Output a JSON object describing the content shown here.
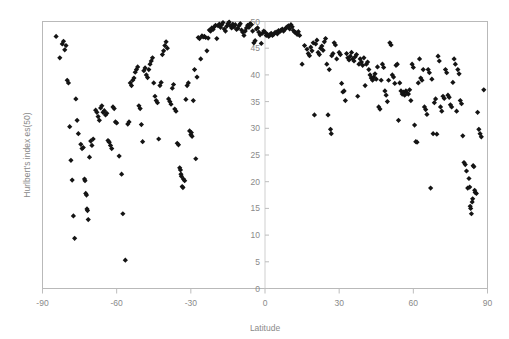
{
  "chart_data": {
    "type": "scatter",
    "title": "",
    "xlabel": "Latitude",
    "ylabel": "Hurlbert's index es(50)",
    "xlim": [
      -90,
      90
    ],
    "ylim": [
      0,
      50
    ],
    "xticks": [
      -90,
      -60,
      -30,
      0,
      30,
      60,
      90
    ],
    "xtick_labels": [
      "-90",
      "-60",
      "-30",
      "0",
      "30",
      "60",
      "90"
    ],
    "yticks": [
      0,
      5,
      10,
      15,
      20,
      25,
      30,
      35,
      40,
      45,
      50
    ],
    "ytick_labels": [
      "0",
      "5",
      "10",
      "15",
      "20",
      "25",
      "30",
      "35",
      "40",
      "45",
      "50"
    ],
    "grid": false,
    "legend": null,
    "marker": "diamond",
    "marker_color": "#141414",
    "marker_size": 4,
    "points": [
      [
        -84.5,
        47.2
      ],
      [
        -83.0,
        43.2
      ],
      [
        -82.0,
        45.8
      ],
      [
        -81.5,
        46.3
      ],
      [
        -81.0,
        44.7
      ],
      [
        -80.5,
        45.5
      ],
      [
        -80.0,
        39.0
      ],
      [
        -79.5,
        38.5
      ],
      [
        -79.0,
        30.3
      ],
      [
        -78.5,
        24.0
      ],
      [
        -78.0,
        20.3
      ],
      [
        -77.5,
        13.6
      ],
      [
        -77.0,
        9.4
      ],
      [
        -76.5,
        35.5
      ],
      [
        -76.0,
        31.5
      ],
      [
        -75.5,
        29.0
      ],
      [
        -74.5,
        27.0
      ],
      [
        -74.0,
        26.2
      ],
      [
        -73.5,
        26.4
      ],
      [
        -73.0,
        20.5
      ],
      [
        -72.8,
        20.2
      ],
      [
        -72.5,
        17.8
      ],
      [
        -72.2,
        17.5
      ],
      [
        -72.0,
        14.9
      ],
      [
        -71.8,
        14.6
      ],
      [
        -71.5,
        12.9
      ],
      [
        -71.0,
        24.6
      ],
      [
        -70.5,
        27.6
      ],
      [
        -70.0,
        26.8
      ],
      [
        -69.5,
        28.0
      ],
      [
        -68.5,
        33.4
      ],
      [
        -68.0,
        33.0
      ],
      [
        -67.5,
        32.2
      ],
      [
        -67.0,
        31.5
      ],
      [
        -66.5,
        33.8
      ],
      [
        -66.0,
        34.2
      ],
      [
        -65.5,
        33.0
      ],
      [
        -65.0,
        33.3
      ],
      [
        -64.5,
        32.5
      ],
      [
        -64.0,
        32.8
      ],
      [
        -63.5,
        27.7
      ],
      [
        -63.0,
        27.4
      ],
      [
        -62.5,
        26.8
      ],
      [
        -62.0,
        26.2
      ],
      [
        -61.5,
        34.0
      ],
      [
        -61.0,
        33.7
      ],
      [
        -60.5,
        31.2
      ],
      [
        -60.0,
        31.0
      ],
      [
        -59.0,
        24.8
      ],
      [
        -58.0,
        21.4
      ],
      [
        -57.5,
        14.0
      ],
      [
        -56.5,
        5.3
      ],
      [
        -55.5,
        30.8
      ],
      [
        -55.0,
        31.2
      ],
      [
        -54.5,
        38.5
      ],
      [
        -54.0,
        38.0
      ],
      [
        -53.5,
        39.0
      ],
      [
        -53.0,
        39.4
      ],
      [
        -52.5,
        40.5
      ],
      [
        -52.0,
        41.0
      ],
      [
        -51.5,
        41.5
      ],
      [
        -51.0,
        34.2
      ],
      [
        -50.5,
        33.7
      ],
      [
        -50.0,
        30.7
      ],
      [
        -49.5,
        27.5
      ],
      [
        -49.0,
        40.8
      ],
      [
        -48.5,
        41.3
      ],
      [
        -48.0,
        40.0
      ],
      [
        -47.5,
        39.5
      ],
      [
        -47.0,
        41.0
      ],
      [
        -46.5,
        42.0
      ],
      [
        -46.0,
        42.6
      ],
      [
        -45.5,
        43.2
      ],
      [
        -45.0,
        38.5
      ],
      [
        -44.5,
        36.0
      ],
      [
        -44.0,
        35.2
      ],
      [
        -43.5,
        34.8
      ],
      [
        -43.0,
        28.0
      ],
      [
        -42.5,
        38.0
      ],
      [
        -42.0,
        38.6
      ],
      [
        -41.5,
        43.8
      ],
      [
        -41.0,
        44.5
      ],
      [
        -40.5,
        45.5
      ],
      [
        -40.0,
        46.2
      ],
      [
        -39.5,
        45.0
      ],
      [
        -39.0,
        35.5
      ],
      [
        -38.5,
        35.0
      ],
      [
        -38.0,
        34.5
      ],
      [
        -37.5,
        37.5
      ],
      [
        -37.0,
        38.2
      ],
      [
        -36.5,
        33.6
      ],
      [
        -36.0,
        33.2
      ],
      [
        -35.5,
        27.2
      ],
      [
        -35.0,
        26.9
      ],
      [
        -34.5,
        22.6
      ],
      [
        -34.2,
        22.2
      ],
      [
        -34.0,
        21.4
      ],
      [
        -33.8,
        21.0
      ],
      [
        -33.5,
        19.1
      ],
      [
        -33.2,
        18.9
      ],
      [
        -33.0,
        20.5
      ],
      [
        -32.5,
        20.2
      ],
      [
        -32.0,
        35.4
      ],
      [
        -31.5,
        38.0
      ],
      [
        -31.0,
        38.5
      ],
      [
        -30.5,
        29.5
      ],
      [
        -30.0,
        28.8
      ],
      [
        -29.8,
        29.2
      ],
      [
        -29.5,
        28.5
      ],
      [
        -29.0,
        35.2
      ],
      [
        -28.5,
        41.0
      ],
      [
        -28.0,
        24.3
      ],
      [
        -27.5,
        39.6
      ],
      [
        -27.0,
        47.0
      ],
      [
        -26.5,
        46.8
      ],
      [
        -26.0,
        43.0
      ],
      [
        -25.5,
        47.3
      ],
      [
        -25.0,
        47.1
      ],
      [
        -24.5,
        47.2
      ],
      [
        -24.0,
        47.0
      ],
      [
        -23.5,
        44.5
      ],
      [
        -23.0,
        46.9
      ],
      [
        -22.5,
        48.4
      ],
      [
        -22.0,
        48.2
      ],
      [
        -21.5,
        48.8
      ],
      [
        -21.0,
        48.5
      ],
      [
        -20.5,
        49.0
      ],
      [
        -20.0,
        49.3
      ],
      [
        -19.5,
        46.8
      ],
      [
        -19.0,
        49.2
      ],
      [
        -18.5,
        49.5
      ],
      [
        -18.0,
        48.9
      ],
      [
        -17.5,
        49.4
      ],
      [
        -17.0,
        49.8
      ],
      [
        -16.5,
        48.6
      ],
      [
        -16.0,
        48.2
      ],
      [
        -15.5,
        49.1
      ],
      [
        -15.0,
        49.6
      ],
      [
        -14.5,
        49.9
      ],
      [
        -14.0,
        49.2
      ],
      [
        -13.5,
        48.8
      ],
      [
        -13.0,
        49.5
      ],
      [
        -12.5,
        49.0
      ],
      [
        -12.0,
        49.4
      ],
      [
        -11.5,
        48.5
      ],
      [
        -11.0,
        48.7
      ],
      [
        -10.5,
        49.2
      ],
      [
        -10.0,
        49.6
      ],
      [
        -9.5,
        48.4
      ],
      [
        -9.0,
        48.0
      ],
      [
        -8.5,
        47.4
      ],
      [
        -8.0,
        48.2
      ],
      [
        -7.5,
        48.8
      ],
      [
        -7.0,
        49.3
      ],
      [
        -6.5,
        48.9
      ],
      [
        -6.0,
        49.6
      ],
      [
        -5.5,
        49.4
      ],
      [
        -5.0,
        48.2
      ],
      [
        -4.5,
        46.0
      ],
      [
        -4.0,
        46.4
      ],
      [
        -3.5,
        48.6
      ],
      [
        -3.0,
        48.8
      ],
      [
        -2.5,
        48.0
      ],
      [
        -2.0,
        47.5
      ],
      [
        -1.5,
        45.9
      ],
      [
        -1.0,
        47.8
      ],
      [
        -0.5,
        48.2
      ],
      [
        0.0,
        48.0
      ],
      [
        0.5,
        47.4
      ],
      [
        1.0,
        47.6
      ],
      [
        1.5,
        47.2
      ],
      [
        2.0,
        47.5
      ],
      [
        2.5,
        47.8
      ],
      [
        3.0,
        47.4
      ],
      [
        3.5,
        47.6
      ],
      [
        4.0,
        47.9
      ],
      [
        4.5,
        48.0
      ],
      [
        5.0,
        47.7
      ],
      [
        5.5,
        48.3
      ],
      [
        6.0,
        48.1
      ],
      [
        6.5,
        48.4
      ],
      [
        7.0,
        48.6
      ],
      [
        7.5,
        48.2
      ],
      [
        8.0,
        48.5
      ],
      [
        8.5,
        48.8
      ],
      [
        9.0,
        49.0
      ],
      [
        9.5,
        49.2
      ],
      [
        10.0,
        48.6
      ],
      [
        10.5,
        49.4
      ],
      [
        11.0,
        49.0
      ],
      [
        11.5,
        48.3
      ],
      [
        12.0,
        48.0
      ],
      [
        12.5,
        47.9
      ],
      [
        13.0,
        47.6
      ],
      [
        13.5,
        48.1
      ],
      [
        14.0,
        47.4
      ],
      [
        15.0,
        42.0
      ],
      [
        16.0,
        45.5
      ],
      [
        17.0,
        44.8
      ],
      [
        17.5,
        44.0
      ],
      [
        18.0,
        43.6
      ],
      [
        18.5,
        45.2
      ],
      [
        19.0,
        44.5
      ],
      [
        19.5,
        46.0
      ],
      [
        20.0,
        32.5
      ],
      [
        20.5,
        45.8
      ],
      [
        21.0,
        46.5
      ],
      [
        21.5,
        44.2
      ],
      [
        22.0,
        43.8
      ],
      [
        22.5,
        45.0
      ],
      [
        23.0,
        45.4
      ],
      [
        23.5,
        44.6
      ],
      [
        24.0,
        46.2
      ],
      [
        24.5,
        46.8
      ],
      [
        25.0,
        42.0
      ],
      [
        25.5,
        32.5
      ],
      [
        26.0,
        41.0
      ],
      [
        26.5,
        29.8
      ],
      [
        26.8,
        29.0
      ],
      [
        27.0,
        43.6
      ],
      [
        27.5,
        44.0
      ],
      [
        28.0,
        46.0
      ],
      [
        28.5,
        45.6
      ],
      [
        29.0,
        43.0
      ],
      [
        30.0,
        44.2
      ],
      [
        30.5,
        43.8
      ],
      [
        31.0,
        38.4
      ],
      [
        31.5,
        36.8
      ],
      [
        32.0,
        37.0
      ],
      [
        32.5,
        35.2
      ],
      [
        33.0,
        44.0
      ],
      [
        33.5,
        43.2
      ],
      [
        34.0,
        42.8
      ],
      [
        34.5,
        43.5
      ],
      [
        35.0,
        44.2
      ],
      [
        35.5,
        43.0
      ],
      [
        36.0,
        42.6
      ],
      [
        36.5,
        43.4
      ],
      [
        37.0,
        43.8
      ],
      [
        37.5,
        36.0
      ],
      [
        38.0,
        42.0
      ],
      [
        38.5,
        43.0
      ],
      [
        39.0,
        42.4
      ],
      [
        39.5,
        41.8
      ],
      [
        40.0,
        43.2
      ],
      [
        40.5,
        38.0
      ],
      [
        41.0,
        42.0
      ],
      [
        41.5,
        42.4
      ],
      [
        42.0,
        41.0
      ],
      [
        42.5,
        40.0
      ],
      [
        43.0,
        39.4
      ],
      [
        43.5,
        39.0
      ],
      [
        44.0,
        39.6
      ],
      [
        44.5,
        40.2
      ],
      [
        45.0,
        39.2
      ],
      [
        45.5,
        41.5
      ],
      [
        46.0,
        34.0
      ],
      [
        46.5,
        33.6
      ],
      [
        47.0,
        39.0
      ],
      [
        47.5,
        42.0
      ],
      [
        48.0,
        41.4
      ],
      [
        48.5,
        37.0
      ],
      [
        49.0,
        36.2
      ],
      [
        49.5,
        35.0
      ],
      [
        50.0,
        39.0
      ],
      [
        50.5,
        46.0
      ],
      [
        51.0,
        45.6
      ],
      [
        51.5,
        40.0
      ],
      [
        52.0,
        39.6
      ],
      [
        52.5,
        38.4
      ],
      [
        53.0,
        41.8
      ],
      [
        53.5,
        42.0
      ],
      [
        54.0,
        31.5
      ],
      [
        54.5,
        38.5
      ],
      [
        55.0,
        37.0
      ],
      [
        55.5,
        36.4
      ],
      [
        56.0,
        36.8
      ],
      [
        56.5,
        36.2
      ],
      [
        57.0,
        37.0
      ],
      [
        57.5,
        36.6
      ],
      [
        58.0,
        36.4
      ],
      [
        58.5,
        37.2
      ],
      [
        59.0,
        35.2
      ],
      [
        59.5,
        42.0
      ],
      [
        60.0,
        41.4
      ],
      [
        60.5,
        30.6
      ],
      [
        61.0,
        27.5
      ],
      [
        61.5,
        27.4
      ],
      [
        62.0,
        38.5
      ],
      [
        62.5,
        43.0
      ],
      [
        63.0,
        39.4
      ],
      [
        63.5,
        39.0
      ],
      [
        64.0,
        41.0
      ],
      [
        64.5,
        34.0
      ],
      [
        65.0,
        33.5
      ],
      [
        65.5,
        32.6
      ],
      [
        66.0,
        41.0
      ],
      [
        66.5,
        40.4
      ],
      [
        67.0,
        18.8
      ],
      [
        67.5,
        39.2
      ],
      [
        68.0,
        29.0
      ],
      [
        68.5,
        34.8
      ],
      [
        69.0,
        35.5
      ],
      [
        69.5,
        28.9
      ],
      [
        70.0,
        43.5
      ],
      [
        70.5,
        42.6
      ],
      [
        71.0,
        34.0
      ],
      [
        71.5,
        33.2
      ],
      [
        72.0,
        36.0
      ],
      [
        72.5,
        35.6
      ],
      [
        73.0,
        41.0
      ],
      [
        73.5,
        40.4
      ],
      [
        74.0,
        36.2
      ],
      [
        74.5,
        35.8
      ],
      [
        75.0,
        34.4
      ],
      [
        75.5,
        34.0
      ],
      [
        76.0,
        38.6
      ],
      [
        76.5,
        43.0
      ],
      [
        77.0,
        42.0
      ],
      [
        77.5,
        33.2
      ],
      [
        78.0,
        41.0
      ],
      [
        78.5,
        40.2
      ],
      [
        79.0,
        35.2
      ],
      [
        79.5,
        34.6
      ],
      [
        80.0,
        28.6
      ],
      [
        80.5,
        23.6
      ],
      [
        81.0,
        23.2
      ],
      [
        81.5,
        22.0
      ],
      [
        82.0,
        18.8
      ],
      [
        82.5,
        20.6
      ],
      [
        82.8,
        19.0
      ],
      [
        83.0,
        15.4
      ],
      [
        83.2,
        15.0
      ],
      [
        83.5,
        14.0
      ],
      [
        83.8,
        16.2
      ],
      [
        84.0,
        16.8
      ],
      [
        84.2,
        23.0
      ],
      [
        84.5,
        22.8
      ],
      [
        84.8,
        18.4
      ],
      [
        85.0,
        18.0
      ],
      [
        85.5,
        17.8
      ],
      [
        86.0,
        33.0
      ],
      [
        86.5,
        29.8
      ],
      [
        87.0,
        29.0
      ],
      [
        87.5,
        28.4
      ],
      [
        88.5,
        37.2
      ]
    ]
  },
  "axis_colors": {
    "frame": "#b9b9b9",
    "zero_axis": "#cfcfcf",
    "tick": "#bdbdbd",
    "label": "#8a8a8a",
    "background": "#ffffff"
  }
}
